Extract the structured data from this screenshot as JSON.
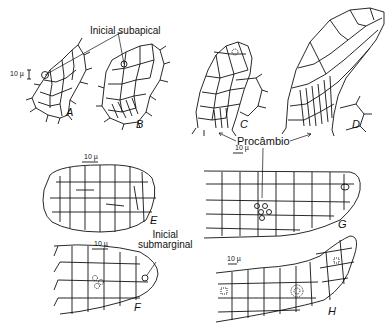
{
  "figure": {
    "annotations": {
      "initial_subapical": "Inicial subapical",
      "procambium": "Procâmbio",
      "initial_submarginal_line1": "Inicial",
      "initial_submarginal_line2": "submarginal"
    },
    "scale_bars": {
      "a": "10 µ",
      "e": "10 µ",
      "f": "10 µ",
      "g": "10 µ",
      "h": "10 µ"
    },
    "panels": [
      {
        "letter": "A"
      },
      {
        "letter": "B"
      },
      {
        "letter": "C"
      },
      {
        "letter": "D"
      },
      {
        "letter": "E"
      },
      {
        "letter": "F"
      },
      {
        "letter": "G"
      },
      {
        "letter": "H"
      }
    ]
  }
}
